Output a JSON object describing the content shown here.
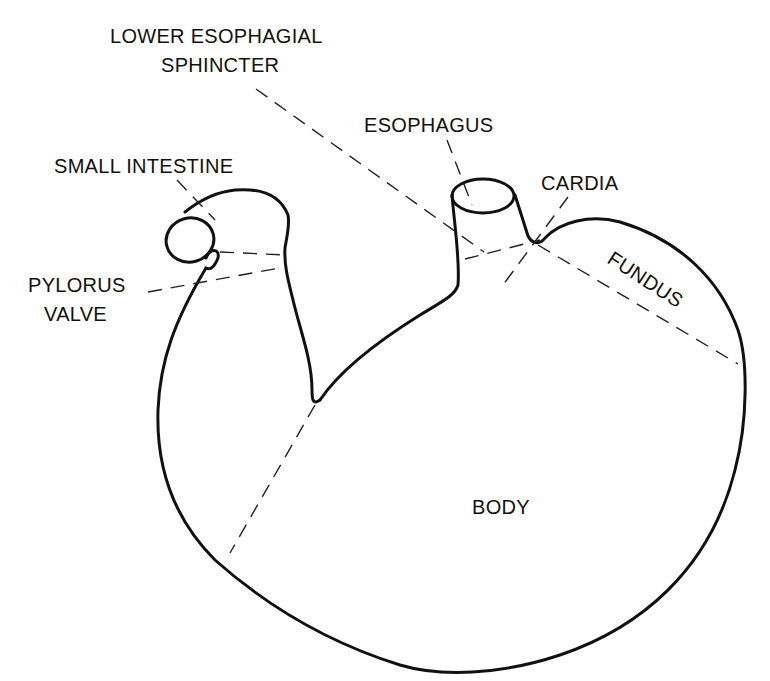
{
  "diagram": {
    "colors": {
      "stroke": "#111111",
      "background": "#ffffff"
    },
    "labels": {
      "les_line1": "LOWER ESOPHAGIAL",
      "les_line2": "SPHINCTER",
      "esophagus": "ESOPHAGUS",
      "small_intestine": "SMALL INTESTINE",
      "cardia": "CARDIA",
      "pylorus_line1": "PYLORUS",
      "pylorus_line2": "VALVE",
      "fundus": "FUNDUS",
      "body": "BODY"
    }
  }
}
